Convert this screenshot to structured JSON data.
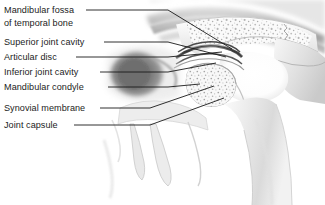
{
  "figure": {
    "style": "grayscale anatomical illustration",
    "background_color": "#ffffff",
    "label_text_color": "#1c1c1c",
    "leader_line_color": "#1a1a1a",
    "width": 325,
    "height": 205
  },
  "labels": [
    {
      "id": "mandibular-fossa",
      "line1": "Mandibular fossa",
      "line2": "of temporal bone",
      "x": 4,
      "y": 13
    },
    {
      "id": "superior-joint-cavity",
      "line1": "Superior joint cavity",
      "line2": "",
      "x": 4,
      "y": 45
    },
    {
      "id": "articular-disc",
      "line1": "Articular disc",
      "line2": "",
      "x": 4,
      "y": 60
    },
    {
      "id": "inferior-joint-cavity",
      "line1": "Inferior joint cavity",
      "line2": "",
      "x": 4,
      "y": 75
    },
    {
      "id": "mandibular-condyle",
      "line1": "Mandibular condyle",
      "line2": "",
      "x": 4,
      "y": 90
    },
    {
      "id": "synovial-membrane",
      "line1": "Synovial membrane",
      "line2": "",
      "x": 4,
      "y": 111
    },
    {
      "id": "joint-capsule",
      "line1": "Joint capsule",
      "line2": "",
      "x": 4,
      "y": 128
    }
  ],
  "leaders": [
    {
      "id": "leader-mandibular-fossa",
      "d": "M 86 10 L 168 10 L 232 49"
    },
    {
      "id": "leader-superior-joint-cavity",
      "d": "M 104 42 L 168 42 L 226 57"
    },
    {
      "id": "leader-articular-disc",
      "d": "M 76 57 L 168 57 L 222 52"
    },
    {
      "id": "leader-inferior-joint-cavity",
      "d": "M 100 72 L 168 72 L 216 63"
    },
    {
      "id": "leader-mandibular-condyle",
      "d": "M 108 87 L 168 87 L 200 84"
    },
    {
      "id": "leader-synovial-membrane",
      "d": "M 100 108 L 150 108 L 214 86"
    },
    {
      "id": "leader-joint-capsule",
      "d": "M 74 125 L 150 125 L 224 98"
    }
  ],
  "anatomy": {
    "regions": [
      {
        "id": "temporal-bone-marrow",
        "kind": "trabecular-bone",
        "tone": "#f2f2f2"
      },
      {
        "id": "mandibular-condyle-marrow",
        "kind": "trabecular-bone",
        "tone": "#f0f0f0"
      },
      {
        "id": "articular-disc-band",
        "kind": "dense-fibrous",
        "tone": "#5a5a5a"
      },
      {
        "id": "external-acoustic-meatus",
        "kind": "canal",
        "tone": "#2a2a2a"
      },
      {
        "id": "soft-tissue-overlay",
        "kind": "soft-tissue",
        "tone": "#c9c9c9"
      },
      {
        "id": "ramus-of-mandible",
        "kind": "cortical-bone",
        "tone": "#e8e8e8"
      },
      {
        "id": "coronoid-teeth-region",
        "kind": "cortical-bone",
        "tone": "#ededed"
      },
      {
        "id": "zygomatic-suture",
        "kind": "suture-line",
        "tone": "#888888"
      }
    ]
  }
}
